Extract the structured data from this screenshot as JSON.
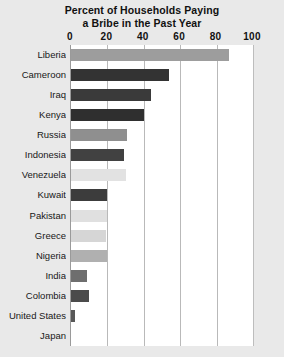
{
  "chart_data": {
    "type": "bar",
    "orientation": "horizontal",
    "title": "Percent of Households Paying a Bribe in the Past Year",
    "title_lines": [
      "Percent of Households Paying",
      "a Bribe in the Past Year"
    ],
    "xlabel": "",
    "ylabel": "",
    "xlim": [
      0,
      100
    ],
    "xticks": [
      0,
      20,
      40,
      60,
      80,
      100
    ],
    "xtick_labels": [
      "0",
      "20",
      "40",
      "60",
      "80",
      "100"
    ],
    "grid": true,
    "grid_axis": "x",
    "legend": false,
    "categories": [
      "Liberia",
      "Cameroon",
      "Iraq",
      "Kenya",
      "Russia",
      "Indonesia",
      "Venezuela",
      "Kuwait",
      "Pakistan",
      "Greece",
      "Nigeria",
      "India",
      "Colombia",
      "United States",
      "Japan"
    ],
    "values": [
      87,
      54,
      44,
      40,
      31,
      29,
      30,
      20,
      20,
      19,
      20,
      9,
      10,
      2,
      0
    ],
    "bar_colors": [
      "#9d9d9d",
      "#333333",
      "#3a3a3a",
      "#2f2f2f",
      "#8f8f8f",
      "#414141",
      "#e2e2e2",
      "#3c3c3c",
      "#e0e0e0",
      "#d6d6d6",
      "#b0b0b0",
      "#6e6e6e",
      "#4b4b4b",
      "#585858",
      "#ededed"
    ]
  },
  "colors": {
    "page_background": "#e9e9e9",
    "plot_background": "#ffffff",
    "gridline": "#b9b9b9",
    "axis": "#9a9a9a",
    "text": "#111111"
  }
}
